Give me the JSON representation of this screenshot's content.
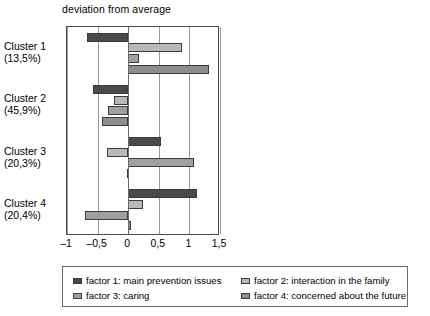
{
  "chart_data": {
    "type": "bar",
    "orientation": "horizontal",
    "title": "deviation from average",
    "xlabel": "",
    "ylabel": "",
    "xlim": [
      -1,
      1.5
    ],
    "grid": true,
    "legend_position": "bottom",
    "xticks": [
      {
        "value": -1,
        "label": "–1"
      },
      {
        "value": -0.5,
        "label": "–0,5"
      },
      {
        "value": 0,
        "label": "0"
      },
      {
        "value": 0.5,
        "label": "0,5"
      },
      {
        "value": 1,
        "label": "1"
      },
      {
        "value": 1.5,
        "label": "1,5"
      }
    ],
    "categories": [
      {
        "name": "Cluster 1",
        "share": "(13,5%)"
      },
      {
        "name": "Cluster 2",
        "share": "(45,9%)"
      },
      {
        "name": "Cluster 3",
        "share": "(20,3%)"
      },
      {
        "name": "Cluster 4",
        "share": "(20,4%)"
      }
    ],
    "series": [
      {
        "name": "factor 1: main prevention issues",
        "color": "#4a4a4a",
        "values": [
          -0.68,
          -0.58,
          0.53,
          1.12
        ]
      },
      {
        "name": "factor 2: interaction in the family",
        "color": "#b8b8b8",
        "values": [
          0.88,
          -0.24,
          -0.35,
          0.25
        ]
      },
      {
        "name": "factor 3: caring",
        "color": "#a0a0a0",
        "values": [
          0.17,
          -0.33,
          1.08,
          -0.7
        ]
      },
      {
        "name": "factor 4: concerned about the future",
        "color": "#8e8e8e",
        "values": [
          1.32,
          -0.43,
          -0.02,
          0.05
        ]
      }
    ]
  },
  "legend": {
    "entries": [
      {
        "label": "factor 1: main prevention issues"
      },
      {
        "label": "factor 2: interaction in the family"
      },
      {
        "label": "factor 3: caring"
      },
      {
        "label": "factor 4: concerned about the future"
      }
    ]
  }
}
